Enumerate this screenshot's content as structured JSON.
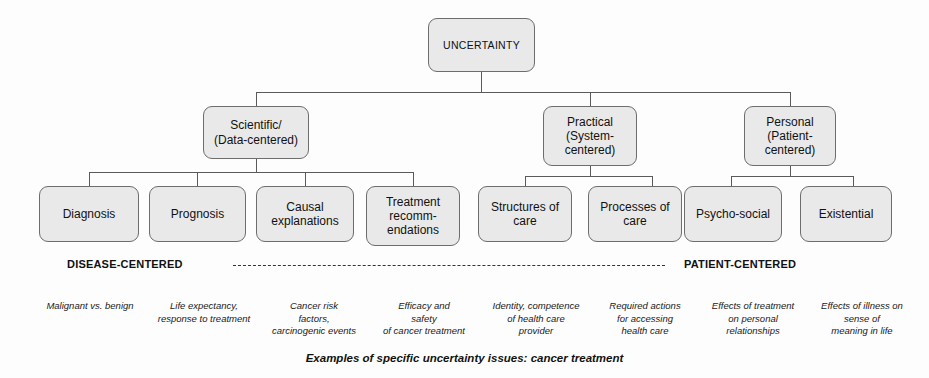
{
  "diagram": {
    "root": {
      "label": "UNCERTAINTY"
    },
    "level2": [
      {
        "label": "Scientific/\n(Data-centered)"
      },
      {
        "label": "Practical\n(System-\ncentered)"
      },
      {
        "label": "Personal\n(Patient-\ncentered)"
      }
    ],
    "level3": [
      {
        "label": "Diagnosis"
      },
      {
        "label": "Prognosis"
      },
      {
        "label": "Causal\nexplanations"
      },
      {
        "label": "Treatment\nrecomm-\nendations"
      },
      {
        "label": "Structures of\ncare"
      },
      {
        "label": "Processes of\ncare"
      },
      {
        "label": "Psycho-social"
      },
      {
        "label": "Existential"
      }
    ],
    "axis": {
      "left_label": "DISEASE-CENTERED",
      "right_label": "PATIENT-CENTERED"
    },
    "examples": [
      {
        "text": "Malignant vs. benign"
      },
      {
        "text": "Life expectancy,\nresponse to treatment"
      },
      {
        "text": "Cancer risk\nfactors,\ncarcinogenic events"
      },
      {
        "text": "Efficacy and\nsafety\nof cancer treatment"
      },
      {
        "text": "Identity, competence\nof health care\nprovider"
      },
      {
        "text": "Required actions\nfor accessing\nhealth care"
      },
      {
        "text": "Effects of treatment\non personal\nrelationships"
      },
      {
        "text": "Effects of illness on\nsense of\nmeaning in life"
      }
    ],
    "caption": "Examples of specific uncertainty issues:  cancer treatment",
    "colors": {
      "box_fill": "#e9e9e9",
      "box_border": "#6d6d6d",
      "line": "#4a4a4a",
      "text": "#111111",
      "background": "#fdfdfd"
    }
  }
}
